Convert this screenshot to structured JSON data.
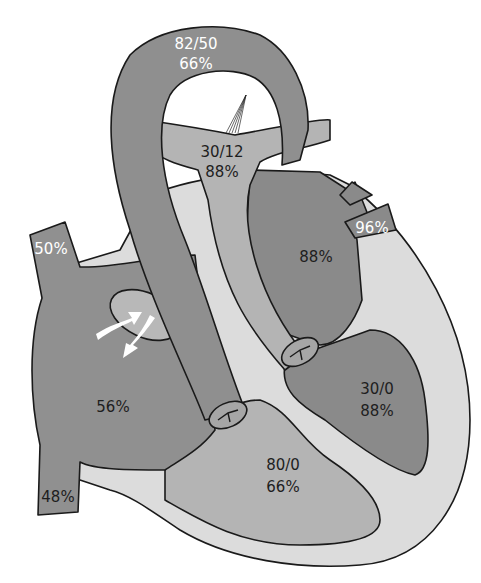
{
  "diagram": {
    "colors": {
      "background": "#ffffff",
      "deoxygenated_dark": "#8f8f8f",
      "oxygenated_dark": "#8a8a8a",
      "mixed_medium": "#a6a6a6",
      "vessel_light": "#b4b4b4",
      "myocardium": "#dcdcdc",
      "outline": "#1a1a1a",
      "arrow": "#ffffff"
    },
    "labels": {
      "aorta_pressure": "82/50",
      "aorta_saturation": "66%",
      "pulmonary_artery_pressure": "30/12",
      "pulmonary_artery_saturation": "88%",
      "superior_vena_cava_saturation": "50%",
      "pulmonary_vein_saturation": "96%",
      "left_atrium_saturation": "88%",
      "right_atrium_saturation": "56%",
      "inferior_vena_cava_saturation": "48%",
      "left_ventricle_pressure": "30/0",
      "left_ventricle_saturation": "88%",
      "right_ventricle_pressure": "80/0",
      "right_ventricle_saturation": "66%"
    },
    "features": [
      {
        "name": "aorta",
        "label_lines": [
          "82/50",
          "66%"
        ]
      },
      {
        "name": "pulmonary-artery",
        "label_lines": [
          "30/12",
          "88%"
        ]
      },
      {
        "name": "ductus-arteriosus-ligament"
      },
      {
        "name": "superior-vena-cava",
        "label_lines": [
          "50%"
        ]
      },
      {
        "name": "pulmonary-veins",
        "label_lines": [
          "96%"
        ]
      },
      {
        "name": "left-atrium",
        "label_lines": [
          "88%"
        ]
      },
      {
        "name": "right-atrium",
        "label_lines": [
          "56%"
        ]
      },
      {
        "name": "inferior-vena-cava",
        "label_lines": [
          "48%"
        ]
      },
      {
        "name": "left-ventricle",
        "label_lines": [
          "30/0",
          "88%"
        ]
      },
      {
        "name": "right-ventricle",
        "label_lines": [
          "80/0",
          "66%"
        ]
      },
      {
        "name": "atrial-septal-defect",
        "arrows": 2
      }
    ]
  }
}
